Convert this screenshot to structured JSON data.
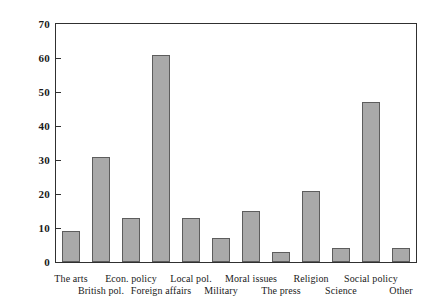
{
  "chart_data": {
    "type": "bar",
    "title": "",
    "subtitle": "",
    "xlabel": "",
    "ylabel": "",
    "categories": [
      "The arts",
      "British pol.",
      "Econ. policy",
      "Foreign affairs",
      "Local pol.",
      "Military",
      "Moral issues",
      "The press",
      "Religion",
      "Science",
      "Social policy",
      "Other"
    ],
    "values": [
      9,
      31,
      13,
      61,
      13,
      7,
      15,
      3,
      21,
      4,
      47,
      4
    ],
    "ylim": [
      0,
      70
    ],
    "yticks": [
      0,
      10,
      20,
      30,
      40,
      50,
      60,
      70
    ],
    "ytick_labels": [
      "0",
      "10",
      "20",
      "30",
      "40",
      "50",
      "60",
      "70"
    ],
    "grid": false,
    "legend": false,
    "legend_position": "none",
    "bar_color": "#a9a9a9",
    "bar_edge_color": "#5d5d5d",
    "axis_color": "#303030",
    "label_stagger": [
      "top",
      "bottom",
      "top",
      "bottom",
      "top",
      "bottom",
      "top",
      "bottom",
      "top",
      "bottom",
      "top",
      "bottom"
    ]
  }
}
